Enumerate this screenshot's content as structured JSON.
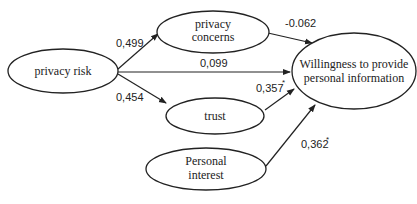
{
  "diagram": {
    "nodes": [
      {
        "id": "privacy_risk",
        "label_lines": [
          "privacy risk"
        ]
      },
      {
        "id": "privacy_concerns",
        "label_lines": [
          "privacy",
          "concerns"
        ]
      },
      {
        "id": "trust",
        "label_lines": [
          "trust"
        ]
      },
      {
        "id": "personal_interest",
        "label_lines": [
          "Personal",
          "interest"
        ]
      },
      {
        "id": "willingness",
        "label_lines": [
          "Willingness to provide",
          "personal information"
        ]
      }
    ],
    "edges": [
      {
        "from": "privacy_risk",
        "to": "privacy_concerns",
        "coefficient": "0,499",
        "significant": false
      },
      {
        "from": "privacy_risk",
        "to": "willingness",
        "coefficient": "0,099",
        "significant": false
      },
      {
        "from": "privacy_risk",
        "to": "trust",
        "coefficient": "0,454",
        "significant": false
      },
      {
        "from": "privacy_concerns",
        "to": "willingness",
        "coefficient": "-0.062",
        "significant": false
      },
      {
        "from": "trust",
        "to": "willingness",
        "coefficient": "0,357",
        "significant": true
      },
      {
        "from": "personal_interest",
        "to": "willingness",
        "coefficient": "0,362",
        "significant": true
      }
    ],
    "significance_marker": "*"
  }
}
